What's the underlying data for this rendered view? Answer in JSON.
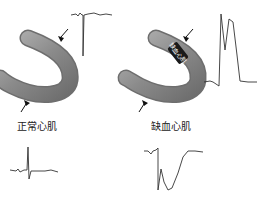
{
  "panels": [
    {
      "id": "normal",
      "label": "正常心肌",
      "electrode_top": "epicardial-electrode",
      "electrode_bottom": "endocardial-electrode",
      "ecg_top": "normal-epicardial-complex",
      "ecg_bottom": "normal-surface-qrs"
    },
    {
      "id": "ischemic",
      "label": "缺血心肌",
      "band_label": "缺血心肌",
      "electrode_top": "epicardial-electrode",
      "electrode_bottom": "endocardial-electrode",
      "ecg_top": "st-elevation-complex",
      "ecg_bottom": "st-depression-complex"
    }
  ],
  "colors": {
    "tube": "#8c8c8c",
    "tube_edge": "#6e6e6e",
    "band": "#1a1a1a",
    "trace": "#333333"
  }
}
